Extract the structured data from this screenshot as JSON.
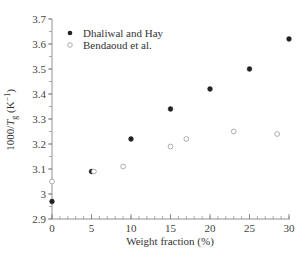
{
  "chart_data": {
    "type": "scatter",
    "title": "",
    "xlabel": "Weight fraction (%)",
    "ylabel": "1000/T_g (K^-1)",
    "ylabel_parts": {
      "prefix": "1000/",
      "italic": "T",
      "sub": "g",
      "suffix": " (K",
      "sup": "−1",
      "close": ")"
    },
    "xlim": [
      0,
      30
    ],
    "ylim": [
      2.9,
      3.7
    ],
    "x_ticks": [
      0,
      5,
      10,
      15,
      20,
      25,
      30
    ],
    "x_tick_labels": [
      "0",
      "5",
      "10",
      "15",
      "20",
      "25",
      "30"
    ],
    "x_minor_step": 1,
    "y_ticks": [
      2.9,
      3.0,
      3.1,
      3.2,
      3.3,
      3.4,
      3.5,
      3.6,
      3.7
    ],
    "y_tick_labels": [
      "2.9",
      "3",
      "3.1",
      "3.2",
      "3.3",
      "3.4",
      "3.5",
      "3.6",
      "3.7"
    ],
    "y_minor_step": 0.05,
    "grid": false,
    "legend_position": "upper left",
    "series": [
      {
        "name": "Dhaliwal and Hay",
        "marker": "filled-circle",
        "color": "#222222",
        "x": [
          0,
          5,
          10,
          15,
          20,
          25,
          30
        ],
        "y": [
          2.97,
          3.09,
          3.22,
          3.34,
          3.42,
          3.5,
          3.62
        ]
      },
      {
        "name": "Bendaoud et al.",
        "marker": "open-circle",
        "color": "#888888",
        "x": [
          0,
          5.3,
          9,
          15,
          17,
          23,
          28.5
        ],
        "y": [
          3.05,
          3.09,
          3.11,
          3.19,
          3.22,
          3.25,
          3.24
        ]
      }
    ]
  },
  "legend": {
    "items": [
      {
        "label": "Dhaliwal and Hay",
        "marker": "filled-circle"
      },
      {
        "label": "Bendaoud et al.",
        "marker": "open-circle"
      }
    ]
  }
}
